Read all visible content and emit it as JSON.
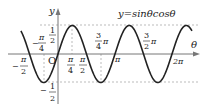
{
  "diagram": {
    "equation": "y=sinθcosθ",
    "axes": {
      "x_label": "θ",
      "y_label": "y",
      "origin_label": "O"
    },
    "y_ticks": [
      {
        "value": 0.5,
        "num": "1",
        "den": "2",
        "sign": ""
      },
      {
        "value": -0.5,
        "num": "1",
        "den": "2",
        "sign": "−"
      }
    ],
    "x_ticks": [
      {
        "pos": -0.5,
        "label_num": "π",
        "label_den": "2",
        "sign": "−"
      },
      {
        "pos": -0.25,
        "label_num": "π",
        "label_den": "4",
        "sign": "−"
      },
      {
        "pos": 0.25,
        "label_num": "π",
        "label_den": "4",
        "sign": ""
      },
      {
        "pos": 0.5,
        "label_num": "π",
        "label_den": "2",
        "sign": ""
      },
      {
        "pos": 0.75,
        "label_num": "3",
        "label_den": "4",
        "suffix": "π"
      },
      {
        "pos": 1,
        "label": "π"
      },
      {
        "pos": 1.5,
        "label_num": "3",
        "label_den": "2",
        "suffix": "π"
      },
      {
        "pos": 2,
        "label": "2π"
      }
    ],
    "colors": {
      "curve": "#222222",
      "axis": "#888888",
      "dashed": "#999999"
    }
  },
  "chart_data": {
    "type": "line",
    "title": "y=sinθcosθ",
    "xlabel": "θ",
    "ylabel": "y",
    "function": "sin(θ)cos(θ) = (1/2)sin(2θ)",
    "xlim": [
      -0.65,
      2.35
    ],
    "xunit": "π",
    "ylim": [
      -0.5,
      0.5
    ],
    "x_tick_labels": [
      "-π/2",
      "-π/4",
      "π/4",
      "π/2",
      "3/4π",
      "π",
      "3/2π",
      "2π"
    ],
    "y_tick_labels": [
      "1/2",
      "-1/2"
    ],
    "key_points": [
      {
        "x": "-π/4",
        "y": -0.5
      },
      {
        "x": "0",
        "y": 0
      },
      {
        "x": "π/4",
        "y": 0.5
      },
      {
        "x": "π/2",
        "y": 0
      },
      {
        "x": "3π/4",
        "y": -0.5
      },
      {
        "x": "π",
        "y": 0
      },
      {
        "x": "5π/4",
        "y": 0.5
      },
      {
        "x": "3π/2",
        "y": 0
      },
      {
        "x": "7π/4",
        "y": -0.5
      },
      {
        "x": "2π",
        "y": 0
      }
    ]
  }
}
